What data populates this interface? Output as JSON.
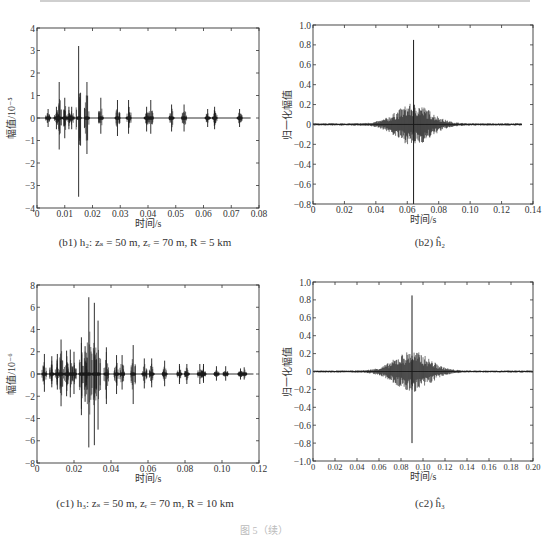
{
  "figure_caption": "图 5（续）",
  "chart_data": [
    {
      "id": "b1",
      "type": "line",
      "title": "",
      "caption": "(b1) h₂: zₛ = 50 m, zᵣ = 70 m, R = 5 km",
      "xlabel": "时间/s",
      "ylabel": "幅值/10⁻⁵",
      "xlim": [
        0,
        0.08
      ],
      "ylim": [
        -4,
        4
      ],
      "xticks": [
        "0",
        "0.01",
        "0.02",
        "0.03",
        "0.04",
        "0.05",
        "0.06",
        "0.07",
        "0.08"
      ],
      "yticks": [
        "-4",
        "-3",
        "-2",
        "-1",
        "0",
        "1",
        "2",
        "3",
        "4"
      ],
      "grid": false,
      "arrivals": [
        {
          "t": 0.004,
          "max": 0.4,
          "min": -0.4
        },
        {
          "t": 0.007,
          "max": 0.5,
          "min": -0.5
        },
        {
          "t": 0.008,
          "max": 1.6,
          "min": -1.4
        },
        {
          "t": 0.01,
          "max": 0.9,
          "min": -0.9
        },
        {
          "t": 0.0115,
          "max": 0.5,
          "min": -0.5
        },
        {
          "t": 0.0125,
          "max": 0.5,
          "min": -0.5
        },
        {
          "t": 0.015,
          "max": 3.2,
          "min": -3.5
        },
        {
          "t": 0.018,
          "max": 1.6,
          "min": -1.6
        },
        {
          "t": 0.023,
          "max": 0.9,
          "min": -0.7
        },
        {
          "t": 0.029,
          "max": 0.8,
          "min": -0.8
        },
        {
          "t": 0.033,
          "max": 0.8,
          "min": -0.7
        },
        {
          "t": 0.0395,
          "max": 0.5,
          "min": -0.6
        },
        {
          "t": 0.041,
          "max": 0.8,
          "min": -0.7
        },
        {
          "t": 0.0485,
          "max": 0.6,
          "min": -0.6
        },
        {
          "t": 0.053,
          "max": 0.6,
          "min": -0.6
        },
        {
          "t": 0.0615,
          "max": 0.4,
          "min": -0.4
        },
        {
          "t": 0.064,
          "max": 0.5,
          "min": -0.5
        },
        {
          "t": 0.073,
          "max": 0.4,
          "min": -0.4
        }
      ],
      "trace_end": 0.077
    },
    {
      "id": "b2",
      "type": "line",
      "title": "",
      "caption": "(b2) ĥ₂",
      "xlabel": "时间/s",
      "ylabel": "归一化幅值",
      "xlim": [
        0,
        0.14
      ],
      "ylim": [
        -0.8,
        1.0
      ],
      "xticks": [
        "0",
        "0.02",
        "0.04",
        "0.06",
        "0.08",
        "0.10",
        "0.12",
        "0.14"
      ],
      "yticks": [
        "-0.8",
        "-0.6",
        "-0.4",
        "-0.2",
        "0",
        "0.2",
        "0.4",
        "0.6",
        "0.8",
        "1.0"
      ],
      "grid": false,
      "peak": {
        "t": 0.064,
        "max": 0.85,
        "min": -0.8
      },
      "envelope": {
        "center": 0.064,
        "amp": 0.2,
        "start": 0.0,
        "end": 0.133
      },
      "trace_end": 0.133
    },
    {
      "id": "c1",
      "type": "line",
      "title": "",
      "caption": "(c1) h₃: zₛ = 50 m, zᵣ = 70 m, R = 10 km",
      "xlabel": "时间/s",
      "ylabel": "幅值/10⁻⁶",
      "xlim": [
        0,
        0.12
      ],
      "ylim": [
        -8,
        8
      ],
      "xticks": [
        "0",
        "0.02",
        "0.04",
        "0.06",
        "0.08",
        "0.10",
        "0.12"
      ],
      "yticks": [
        "-8",
        "-6",
        "-4",
        "-2",
        "0",
        "2",
        "4",
        "6",
        "8"
      ],
      "grid": false,
      "arrivals": [
        {
          "t": 0.004,
          "max": 1.8,
          "min": -1.6
        },
        {
          "t": 0.008,
          "max": 1.6,
          "min": -1.2
        },
        {
          "t": 0.011,
          "max": 1.8,
          "min": -1.4
        },
        {
          "t": 0.013,
          "max": 3.1,
          "min": -2.9
        },
        {
          "t": 0.016,
          "max": 2.1,
          "min": -2.0
        },
        {
          "t": 0.018,
          "max": 2.2,
          "min": -2.1
        },
        {
          "t": 0.02,
          "max": 2.0,
          "min": -1.8
        },
        {
          "t": 0.024,
          "max": 3.3,
          "min": -3.7
        },
        {
          "t": 0.026,
          "max": 2.5,
          "min": -2.5
        },
        {
          "t": 0.028,
          "max": 6.9,
          "min": -6.6
        },
        {
          "t": 0.031,
          "max": 6.4,
          "min": -6.4
        },
        {
          "t": 0.033,
          "max": 4.8,
          "min": -5.0
        },
        {
          "t": 0.0375,
          "max": 2.4,
          "min": -2.7
        },
        {
          "t": 0.043,
          "max": 1.7,
          "min": -1.8
        },
        {
          "t": 0.046,
          "max": 1.7,
          "min": -1.4
        },
        {
          "t": 0.052,
          "max": 2.6,
          "min": -2.7
        },
        {
          "t": 0.058,
          "max": 1.4,
          "min": -1.3
        },
        {
          "t": 0.062,
          "max": 1.4,
          "min": -1.2
        },
        {
          "t": 0.069,
          "max": 1.2,
          "min": -1.1
        },
        {
          "t": 0.077,
          "max": 0.9,
          "min": -0.9
        },
        {
          "t": 0.081,
          "max": 0.9,
          "min": -0.9
        },
        {
          "t": 0.088,
          "max": 0.9,
          "min": -0.9
        },
        {
          "t": 0.09,
          "max": 0.9,
          "min": -0.8
        },
        {
          "t": 0.097,
          "max": 0.7,
          "min": -0.6
        },
        {
          "t": 0.102,
          "max": 0.7,
          "min": -0.6
        },
        {
          "t": 0.11,
          "max": 0.5,
          "min": -0.5
        },
        {
          "t": 0.112,
          "max": 0.6,
          "min": -0.5
        }
      ],
      "trace_end": 0.117
    },
    {
      "id": "c2",
      "type": "line",
      "title": "",
      "caption": "(c2) ĥ₃",
      "xlabel": "时间/s",
      "ylabel": "归一化幅值",
      "xlim": [
        0,
        0.2
      ],
      "ylim": [
        -1.0,
        1.0
      ],
      "xticks": [
        "0",
        "0.02",
        "0.04",
        "0.06",
        "0.08",
        "0.10",
        "0.12",
        "0.14",
        "0.16",
        "0.18",
        "0.20"
      ],
      "yticks": [
        "-1.0",
        "-0.8",
        "-0.6",
        "-0.4",
        "-0.2",
        "0",
        "0.2",
        "0.4",
        "0.6",
        "0.8",
        "1.0"
      ],
      "grid": false,
      "peak": {
        "t": 0.09,
        "max": 0.85,
        "min": -0.8
      },
      "envelope": {
        "center": 0.09,
        "amp": 0.22,
        "start": 0.0,
        "end": 0.2
      },
      "trace_end": 0.2
    }
  ]
}
